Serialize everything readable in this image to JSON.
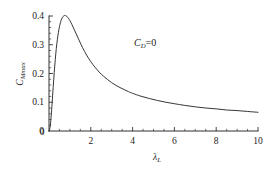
{
  "chart_data": {
    "type": "line",
    "title": "",
    "subtitle": "",
    "xlabel": "λ",
    "xlabel_sub": "L",
    "ylabel": "C",
    "ylabel_sub": "Mmax",
    "xlim": [
      0,
      10
    ],
    "ylim": [
      0,
      0.4
    ],
    "grid": false,
    "legend": "none",
    "annotations": [
      {
        "text_main": "C",
        "text_sub": "D",
        "text_tail": "=0",
        "x": 4.6,
        "y": 0.295
      }
    ],
    "x_ticks_major": [
      0,
      2,
      4,
      6,
      8,
      10
    ],
    "x_tick_labels": [
      "0",
      "2",
      "4",
      "6",
      "8",
      "10"
    ],
    "x_ticks_minor_step": 0.5,
    "y_ticks_major": [
      0,
      0.1,
      0.2,
      0.3,
      0.4
    ],
    "y_tick_labels": [
      "0",
      "0.1",
      "0.2",
      "0.3",
      "0.4"
    ],
    "y_ticks_minor_step": 0.02,
    "series": [
      {
        "name": "CMmax",
        "x": [
          0.0,
          0.05,
          0.1,
          0.15,
          0.2,
          0.25,
          0.3,
          0.35,
          0.4,
          0.45,
          0.5,
          0.55,
          0.6,
          0.65,
          0.7,
          0.75,
          0.8,
          0.85,
          0.9,
          0.95,
          1.0,
          1.1,
          1.2,
          1.3,
          1.4,
          1.5,
          1.6,
          1.7,
          1.8,
          1.9,
          2.0,
          2.2,
          2.4,
          2.6,
          2.8,
          3.0,
          3.2,
          3.4,
          3.6,
          3.8,
          4.0,
          4.4,
          4.8,
          5.2,
          5.6,
          6.0,
          6.5,
          7.0,
          7.5,
          8.0,
          8.5,
          9.0,
          9.5,
          10.0
        ],
        "y": [
          0.0,
          0.012,
          0.048,
          0.098,
          0.152,
          0.203,
          0.248,
          0.287,
          0.318,
          0.343,
          0.363,
          0.378,
          0.389,
          0.396,
          0.4,
          0.402,
          0.401,
          0.399,
          0.395,
          0.39,
          0.384,
          0.37,
          0.354,
          0.338,
          0.322,
          0.306,
          0.291,
          0.277,
          0.264,
          0.252,
          0.241,
          0.222,
          0.205,
          0.191,
          0.179,
          0.168,
          0.159,
          0.151,
          0.144,
          0.137,
          0.131,
          0.121,
          0.113,
          0.106,
          0.1,
          0.095,
          0.089,
          0.084,
          0.08,
          0.077,
          0.073,
          0.071,
          0.068,
          0.065
        ]
      }
    ]
  },
  "colors": {
    "background": "#ffffff",
    "axis": "#1a1a1a",
    "curve": "#2b2b2b"
  }
}
